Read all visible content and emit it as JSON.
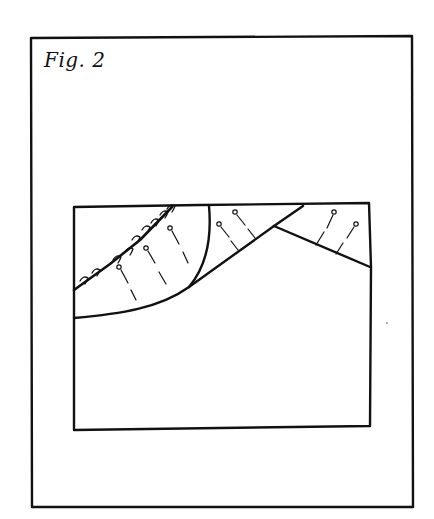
{
  "figure": {
    "caption": "Fig. 2",
    "ink_color": "#111111",
    "background": "#ffffff",
    "outer_frame": {
      "x1": 31,
      "y1": 37,
      "x2": 413,
      "y2": 507
    },
    "inner_block": {
      "x1": 74,
      "y1": 205,
      "x2": 371,
      "y2": 429
    },
    "elements": [
      "hooked-bedding-line",
      "curved-fault",
      "rising-fault",
      "right-dipping-fault",
      "pin-markers-left-wedge",
      "pin-markers-middle-wedge",
      "pin-markers-right-wedge"
    ]
  }
}
